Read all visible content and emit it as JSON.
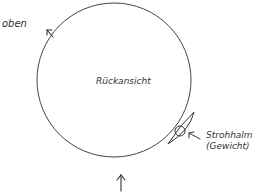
{
  "diagram": {
    "title": "Rückansicht",
    "labels": {
      "top": "oben",
      "center": "Rückansicht",
      "straw_line1": "Strohhalm",
      "straw_line2": "(Gewicht)"
    },
    "colors": {
      "stroke": "#444444",
      "text": "#333333",
      "background": "#ffffff"
    },
    "elements": [
      {
        "type": "circle",
        "name": "wheel-outline"
      },
      {
        "type": "arrow",
        "name": "top-arrow",
        "direction": "up-left"
      },
      {
        "type": "arrow",
        "name": "bottom-arrow",
        "direction": "up"
      },
      {
        "type": "straw-weight",
        "name": "straw-weight",
        "label": "Strohhalm (Gewicht)"
      }
    ]
  }
}
